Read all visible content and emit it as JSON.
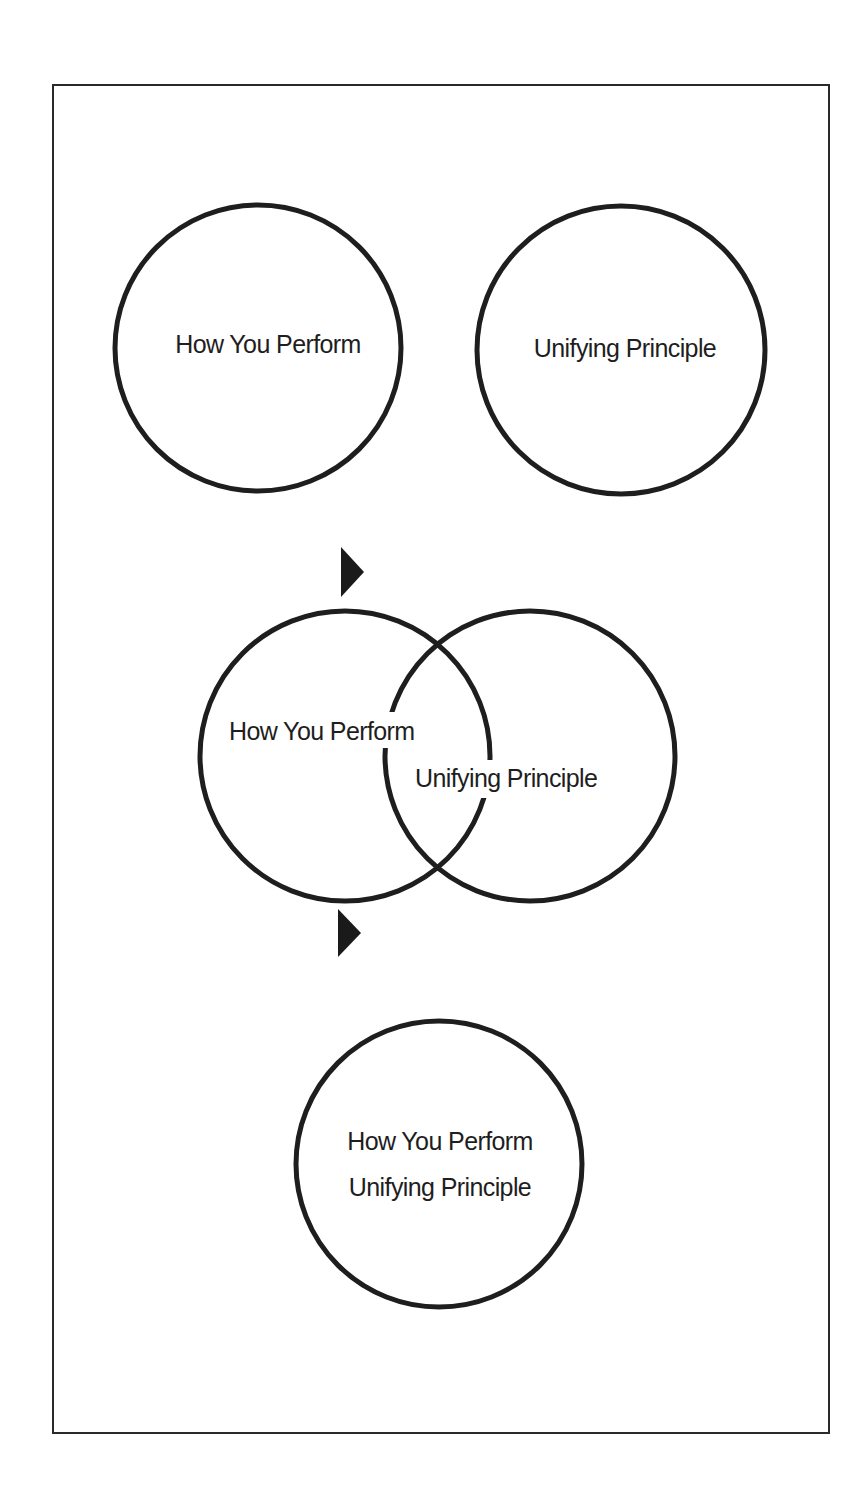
{
  "diagram": {
    "stage1": {
      "left_circle": {
        "label": "How You Perform"
      },
      "right_circle": {
        "label": "Unifying Principle"
      }
    },
    "arrow1": {
      "icon": "right-triangle-arrow"
    },
    "stage2": {
      "left_circle": {
        "label": "How You Perform"
      },
      "right_circle": {
        "label": "Unifying Principle"
      }
    },
    "arrow2": {
      "icon": "right-triangle-arrow"
    },
    "stage3": {
      "merged_circle": {
        "line1": "How You Perform",
        "line2": "Unifying Principle"
      }
    },
    "colors": {
      "stroke": "#1e1e1e",
      "background": "#ffffff"
    }
  }
}
